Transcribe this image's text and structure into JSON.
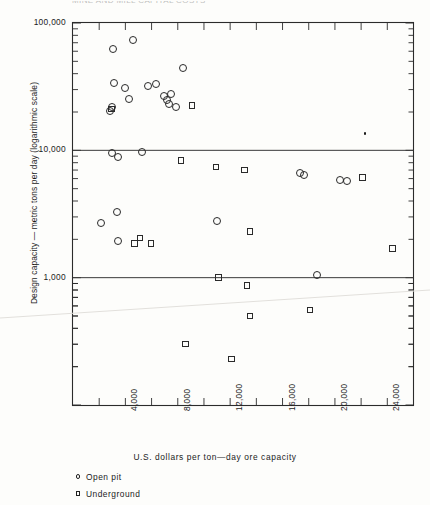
{
  "figure": {
    "cut_title": "MINE AND MILL CAPITAL COSTS"
  },
  "legend": {
    "position": "below-axis-left",
    "items": [
      {
        "symbol": "circle",
        "label": "Open pit"
      },
      {
        "symbol": "square",
        "label": "Underground"
      }
    ]
  },
  "chart_data": {
    "type": "scatter",
    "title": "",
    "xlabel": "U.S. dollars per ton—day ore capacity",
    "ylabel": "Design capacity — metric tons per day (logarithmic scale)",
    "xlim": [
      0,
      26000
    ],
    "ylim": [
      100,
      100000
    ],
    "yscale": "log",
    "xscale": "linear",
    "grid": false,
    "gridlines": [
      "10,000",
      "1,000"
    ],
    "xticks": [
      2000,
      4000,
      6000,
      8000,
      10000,
      12000,
      14000,
      16000,
      18000,
      20000,
      22000,
      24000,
      26000
    ],
    "xtick_labels": [
      "",
      "4,000",
      "",
      "8,000",
      "",
      "12,000",
      "",
      "16,000",
      "",
      "20,000",
      "",
      "24,000",
      ""
    ],
    "yticks": [
      1000,
      10000,
      100000
    ],
    "ytick_labels": [
      "1,000",
      "10,000",
      "100,000"
    ],
    "series": [
      {
        "name": "Open pit",
        "symbol": "circle",
        "points": [
          {
            "x": 3050,
            "y": 62000
          },
          {
            "x": 4550,
            "y": 74000
          },
          {
            "x": 3150,
            "y": 34000
          },
          {
            "x": 3950,
            "y": 31000
          },
          {
            "x": 5750,
            "y": 32000
          },
          {
            "x": 6350,
            "y": 33000
          },
          {
            "x": 8400,
            "y": 44000
          },
          {
            "x": 4300,
            "y": 25500
          },
          {
            "x": 2950,
            "y": 22000
          },
          {
            "x": 2800,
            "y": 20500
          },
          {
            "x": 6950,
            "y": 26500
          },
          {
            "x": 7200,
            "y": 25000
          },
          {
            "x": 7450,
            "y": 27500
          },
          {
            "x": 7350,
            "y": 23000
          },
          {
            "x": 7850,
            "y": 22000
          },
          {
            "x": 3000,
            "y": 9600
          },
          {
            "x": 3400,
            "y": 8800
          },
          {
            "x": 5250,
            "y": 9700
          },
          {
            "x": 17350,
            "y": 6600
          },
          {
            "x": 17650,
            "y": 6400
          },
          {
            "x": 20400,
            "y": 5900
          },
          {
            "x": 20900,
            "y": 5700
          },
          {
            "x": 3350,
            "y": 3300
          },
          {
            "x": 2100,
            "y": 2700
          },
          {
            "x": 11000,
            "y": 2800
          },
          {
            "x": 3400,
            "y": 1950
          },
          {
            "x": 18600,
            "y": 1050
          }
        ]
      },
      {
        "name": "Underground",
        "symbol": "square",
        "points": [
          {
            "x": 2950,
            "y": 21000
          },
          {
            "x": 9100,
            "y": 22500
          },
          {
            "x": 8250,
            "y": 8300
          },
          {
            "x": 10900,
            "y": 7400
          },
          {
            "x": 13100,
            "y": 7000
          },
          {
            "x": 22100,
            "y": 6100
          },
          {
            "x": 5100,
            "y": 2050
          },
          {
            "x": 4700,
            "y": 1850
          },
          {
            "x": 5950,
            "y": 1850
          },
          {
            "x": 13500,
            "y": 2300
          },
          {
            "x": 24400,
            "y": 1700
          },
          {
            "x": 11100,
            "y": 1000
          },
          {
            "x": 13300,
            "y": 870
          },
          {
            "x": 13500,
            "y": 500
          },
          {
            "x": 18100,
            "y": 560
          },
          {
            "x": 8600,
            "y": 300
          },
          {
            "x": 12100,
            "y": 230
          }
        ]
      },
      {
        "name": "Unlabeled point",
        "symbol": "dot",
        "points": [
          {
            "x": 22300,
            "y": 13500
          }
        ]
      }
    ]
  }
}
